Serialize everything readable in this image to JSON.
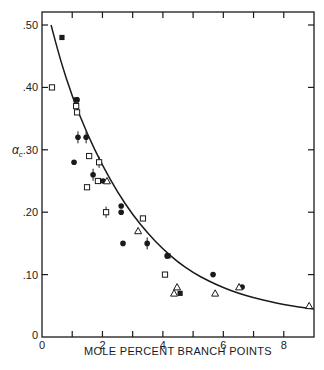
{
  "chart_data": {
    "type": "scatter",
    "title": "",
    "xlabel": "MOLE PERCENT BRANCH POINTS",
    "ylabel": "αc",
    "xlim": [
      0,
      9
    ],
    "ylim": [
      0,
      0.52
    ],
    "grid": false,
    "legend": "none",
    "x_ticks": [
      0,
      1,
      2,
      3,
      4,
      5,
      6,
      7,
      8,
      9
    ],
    "x_tick_labels": [
      {
        "value": 0,
        "label": "0"
      },
      {
        "value": 2,
        "label": "2"
      },
      {
        "value": 4,
        "label": "4"
      },
      {
        "value": 6,
        "label": "6"
      },
      {
        "value": 8,
        "label": "8"
      }
    ],
    "y_tick_labels": [
      {
        "value": 0,
        "label": "0"
      },
      {
        "value": 0.1,
        "label": ".10"
      },
      {
        "value": 0.2,
        "label": ".20"
      },
      {
        "value": 0.3,
        "label": ".30"
      },
      {
        "value": 0.4,
        "label": ".40"
      },
      {
        "value": 0.5,
        "label": ".50"
      }
    ],
    "series": [
      {
        "name": "filled-square",
        "marker": "filled-square",
        "points": [
          [
            0.66,
            0.48
          ],
          [
            1.13,
            0.38
          ],
          [
            4.57,
            0.07
          ],
          [
            4.17,
            0.13
          ]
        ]
      },
      {
        "name": "open-square",
        "marker": "open-square",
        "points": [
          [
            0.33,
            0.4
          ],
          [
            1.13,
            0.37
          ],
          [
            1.16,
            0.36
          ],
          [
            1.56,
            0.29
          ],
          [
            1.85,
            0.25
          ],
          [
            1.49,
            0.24
          ],
          [
            3.34,
            0.19
          ],
          [
            4.07,
            0.1
          ]
        ]
      },
      {
        "name": "open-square-ticked",
        "marker": "open-square-tick",
        "points": [
          [
            1.89,
            0.28
          ],
          [
            2.12,
            0.2
          ]
        ]
      },
      {
        "name": "filled-circle",
        "marker": "filled-circle",
        "points": [
          [
            1.16,
            0.38
          ],
          [
            1.06,
            0.28
          ],
          [
            2.02,
            0.25
          ],
          [
            2.62,
            0.21
          ],
          [
            2.62,
            0.2
          ],
          [
            2.68,
            0.15
          ],
          [
            4.14,
            0.13
          ],
          [
            5.66,
            0.1
          ],
          [
            6.62,
            0.08
          ]
        ]
      },
      {
        "name": "filled-circle-ticked",
        "marker": "filled-circle-tick",
        "points": [
          [
            1.19,
            0.32
          ],
          [
            1.46,
            0.32
          ],
          [
            1.69,
            0.26
          ],
          [
            3.48,
            0.15
          ]
        ]
      },
      {
        "name": "open-triangle",
        "marker": "open-triangle",
        "points": [
          [
            2.15,
            0.25
          ],
          [
            3.18,
            0.17
          ],
          [
            4.47,
            0.08
          ],
          [
            4.37,
            0.07
          ],
          [
            5.73,
            0.07
          ],
          [
            6.52,
            0.08
          ],
          [
            8.84,
            0.05
          ]
        ]
      }
    ],
    "fit_curve": {
      "name": "fitted curve",
      "points": [
        [
          0.3,
          0.5
        ],
        [
          0.6,
          0.445
        ],
        [
          1.0,
          0.385
        ],
        [
          1.5,
          0.325
        ],
        [
          2.0,
          0.275
        ],
        [
          2.5,
          0.232
        ],
        [
          3.0,
          0.196
        ],
        [
          3.5,
          0.166
        ],
        [
          4.0,
          0.141
        ],
        [
          4.5,
          0.12
        ],
        [
          5.0,
          0.103
        ],
        [
          5.5,
          0.09
        ],
        [
          6.0,
          0.079
        ],
        [
          6.5,
          0.07
        ],
        [
          7.0,
          0.063
        ],
        [
          7.5,
          0.057
        ],
        [
          8.0,
          0.052
        ],
        [
          8.5,
          0.048
        ],
        [
          9.0,
          0.045
        ]
      ]
    }
  },
  "colors": {
    "ink": "#1a1a1a",
    "background": "#ffffff"
  }
}
